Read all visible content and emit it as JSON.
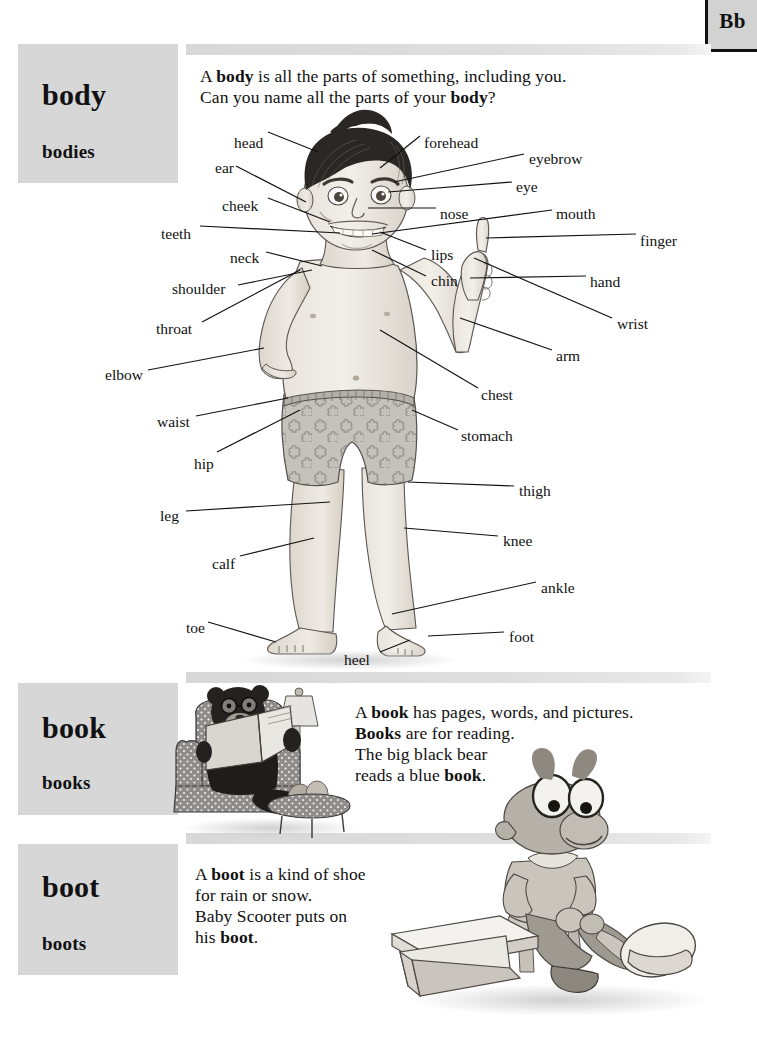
{
  "page": {
    "letter_tab": "Bb",
    "background": "#ffffff",
    "band_color": "#dcdcdc",
    "headword_box_color": "#d7d7d7"
  },
  "entries": [
    {
      "headword": "body",
      "plural": "bodies",
      "definition_lines": [
        [
          {
            "t": "A ",
            "b": false
          },
          {
            "t": "body",
            "b": true
          },
          {
            "t": " is all the parts of something, including you.",
            "b": false
          }
        ],
        [
          {
            "t": "Can you name all the parts of your ",
            "b": false
          },
          {
            "t": "body",
            "b": true
          },
          {
            "t": "?",
            "b": false
          }
        ]
      ],
      "illustration": "boy-pointing-figure",
      "diagram_labels": [
        {
          "text": "head",
          "x": 234,
          "y": 135
        },
        {
          "text": "ear",
          "x": 215,
          "y": 160
        },
        {
          "text": "cheek",
          "x": 222,
          "y": 198
        },
        {
          "text": "teeth",
          "x": 161,
          "y": 226
        },
        {
          "text": "neck",
          "x": 230,
          "y": 250
        },
        {
          "text": "shoulder",
          "x": 172,
          "y": 281
        },
        {
          "text": "throat",
          "x": 156,
          "y": 321
        },
        {
          "text": "elbow",
          "x": 105,
          "y": 367
        },
        {
          "text": "waist",
          "x": 157,
          "y": 414
        },
        {
          "text": "hip",
          "x": 194,
          "y": 456
        },
        {
          "text": "leg",
          "x": 160,
          "y": 508
        },
        {
          "text": "calf",
          "x": 212,
          "y": 556
        },
        {
          "text": "toe",
          "x": 186,
          "y": 620
        },
        {
          "text": "heel",
          "x": 344,
          "y": 652
        },
        {
          "text": "forehead",
          "x": 424,
          "y": 135
        },
        {
          "text": "eyebrow",
          "x": 529,
          "y": 151
        },
        {
          "text": "eye",
          "x": 516,
          "y": 179
        },
        {
          "text": "nose",
          "x": 440,
          "y": 206
        },
        {
          "text": "mouth",
          "x": 556,
          "y": 206
        },
        {
          "text": "finger",
          "x": 640,
          "y": 233
        },
        {
          "text": "lips",
          "x": 431,
          "y": 247
        },
        {
          "text": "chin",
          "x": 431,
          "y": 273
        },
        {
          "text": "hand",
          "x": 590,
          "y": 274
        },
        {
          "text": "wrist",
          "x": 617,
          "y": 316
        },
        {
          "text": "arm",
          "x": 556,
          "y": 348
        },
        {
          "text": "chest",
          "x": 481,
          "y": 387
        },
        {
          "text": "stomach",
          "x": 461,
          "y": 428
        },
        {
          "text": "thigh",
          "x": 519,
          "y": 483
        },
        {
          "text": "knee",
          "x": 503,
          "y": 533
        },
        {
          "text": "ankle",
          "x": 541,
          "y": 580
        },
        {
          "text": "foot",
          "x": 509,
          "y": 629
        }
      ]
    },
    {
      "headword": "book",
      "plural": "books",
      "definition_lines": [
        [
          {
            "t": "A ",
            "b": false
          },
          {
            "t": "book",
            "b": true
          },
          {
            "t": " has pages, words, and pictures.",
            "b": false
          }
        ],
        [
          {
            "t": "Books",
            "b": true
          },
          {
            "t": " are for reading.",
            "b": false
          }
        ],
        [
          {
            "t": "The big black bear",
            "b": false
          }
        ],
        [
          {
            "t": "reads a blue ",
            "b": false
          },
          {
            "t": "book",
            "b": true
          },
          {
            "t": ".",
            "b": false
          }
        ]
      ],
      "illustration": "bear-reading-in-armchair"
    },
    {
      "headword": "boot",
      "plural": "boots",
      "definition_lines": [
        [
          {
            "t": "A ",
            "b": false
          },
          {
            "t": "boot",
            "b": true
          },
          {
            "t": " is a kind of shoe",
            "b": false
          }
        ],
        [
          {
            "t": "for rain or snow.",
            "b": false
          }
        ],
        [
          {
            "t": "Baby Scooter puts on",
            "b": false
          }
        ],
        [
          {
            "t": "his ",
            "b": false
          },
          {
            "t": "boot",
            "b": true
          },
          {
            "t": ".",
            "b": false
          }
        ]
      ],
      "illustration": "scooter-putting-on-boot-with-shoebox"
    }
  ]
}
